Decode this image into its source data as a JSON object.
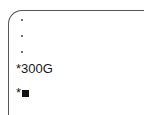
{
  "panel": {
    "bullets": [
      {
        "icon": "dot-icon"
      },
      {
        "icon": "dot-icon"
      },
      {
        "icon": "dot-icon"
      }
    ],
    "lines": [
      {
        "prefix": "*",
        "text": "300G"
      },
      {
        "prefix": "*",
        "icon": "black-square-icon"
      }
    ]
  },
  "colors": {
    "border": "#555555",
    "text": "#1a1a1a",
    "background": "#ffffff"
  }
}
